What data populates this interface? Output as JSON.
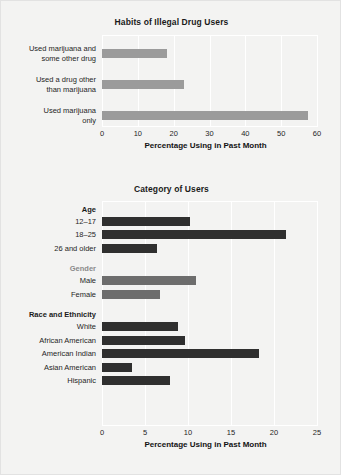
{
  "figure": {
    "background_color": "#f3f3f2",
    "border_color": "#e2e2e2"
  },
  "chart_data": [
    {
      "id": "habits",
      "type": "bar",
      "orientation": "horizontal",
      "title": "Habits of Illegal Drug Users",
      "xlabel": "Percentage Using in Past Month",
      "ylabel": "",
      "xlim": [
        0,
        60
      ],
      "xticks": [
        0,
        10,
        20,
        30,
        40,
        50,
        60
      ],
      "xtick_labels": [
        "0",
        "10",
        "20",
        "30",
        "40",
        "50",
        "60"
      ],
      "grid": true,
      "legend": "none",
      "bar_color": "#9b9b9b",
      "categories": [
        "Used marijuana and\nsome other drug",
        "Used a drug other\nthan marijuana",
        "Used marijuana\nonly"
      ],
      "category_lines": [
        [
          "Used marijuana and",
          "some other drug"
        ],
        [
          "Used a drug other",
          "than marijuana"
        ],
        [
          "Used marijuana",
          "only"
        ]
      ],
      "values": [
        18.0,
        23.0,
        57.5
      ]
    },
    {
      "id": "category",
      "type": "bar",
      "orientation": "horizontal",
      "title": "Category of Users",
      "xlabel": "Percentage Using in Past Month",
      "ylabel": "",
      "xlim": [
        0,
        25
      ],
      "xticks": [
        0,
        5,
        10,
        15,
        20,
        25
      ],
      "xtick_labels": [
        "0",
        "5",
        "10",
        "15",
        "20",
        "25"
      ],
      "grid": true,
      "legend": "none",
      "groups": [
        {
          "name": "Age",
          "label_style": "dark",
          "bar_color": "#2f2f2f",
          "categories": [
            "12–17",
            "18–25",
            "26 and older"
          ],
          "values": [
            10.2,
            21.4,
            6.4
          ]
        },
        {
          "name": "Gender",
          "label_style": "grey",
          "bar_color": "#6d6d6d",
          "categories": [
            "Male",
            "Female"
          ],
          "values": [
            10.9,
            6.7
          ]
        },
        {
          "name": "Race and Ethnicity",
          "label_style": "dark",
          "bar_color": "#2f2f2f",
          "categories": [
            "White",
            "African American",
            "American Indian",
            "Asian American",
            "Hispanic"
          ],
          "values": [
            8.8,
            9.7,
            18.3,
            3.5,
            7.9
          ]
        }
      ]
    }
  ]
}
